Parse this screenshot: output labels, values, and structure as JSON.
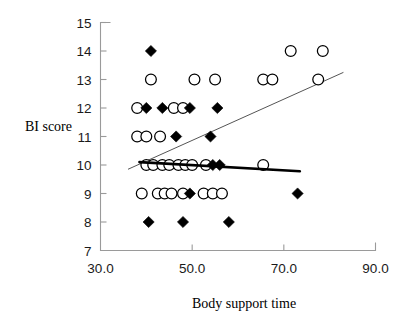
{
  "chart_data": {
    "type": "scatter",
    "title": "",
    "xlabel": "Body support time",
    "ylabel": "BI score",
    "xlim": [
      30.0,
      90.0
    ],
    "ylim": [
      7,
      15
    ],
    "xticks": [
      30.0,
      50.0,
      70.0,
      90.0
    ],
    "xtick_labels": [
      "30.0",
      "50.0",
      "70.0",
      "90.0"
    ],
    "yticks": [
      7,
      8,
      9,
      10,
      11,
      12,
      13,
      14,
      15
    ],
    "ytick_labels": [
      "7",
      "8",
      "9",
      "10",
      "11",
      "12",
      "13",
      "14",
      "15"
    ],
    "grid": false,
    "legend": "none",
    "series": [
      {
        "name": "open-circle-group",
        "marker": "open-circle",
        "color": "#ffffff",
        "edge_color": "#000000",
        "points": [
          {
            "x": 71.5,
            "y": 14
          },
          {
            "x": 78.5,
            "y": 14
          },
          {
            "x": 41.0,
            "y": 13
          },
          {
            "x": 50.5,
            "y": 13
          },
          {
            "x": 55.0,
            "y": 13
          },
          {
            "x": 65.5,
            "y": 13
          },
          {
            "x": 67.5,
            "y": 13
          },
          {
            "x": 77.5,
            "y": 13
          },
          {
            "x": 38.0,
            "y": 12
          },
          {
            "x": 46.0,
            "y": 12
          },
          {
            "x": 48.0,
            "y": 12
          },
          {
            "x": 38.0,
            "y": 11
          },
          {
            "x": 40.0,
            "y": 11
          },
          {
            "x": 43.0,
            "y": 11
          },
          {
            "x": 40.0,
            "y": 10
          },
          {
            "x": 41.5,
            "y": 10
          },
          {
            "x": 43.5,
            "y": 10
          },
          {
            "x": 45.0,
            "y": 10
          },
          {
            "x": 47.0,
            "y": 10
          },
          {
            "x": 48.5,
            "y": 10
          },
          {
            "x": 50.0,
            "y": 10
          },
          {
            "x": 53.0,
            "y": 10
          },
          {
            "x": 65.5,
            "y": 10
          },
          {
            "x": 39.0,
            "y": 9
          },
          {
            "x": 42.5,
            "y": 9
          },
          {
            "x": 44.0,
            "y": 9
          },
          {
            "x": 45.5,
            "y": 9
          },
          {
            "x": 48.0,
            "y": 9
          },
          {
            "x": 52.5,
            "y": 9
          },
          {
            "x": 54.5,
            "y": 9
          },
          {
            "x": 56.5,
            "y": 9
          }
        ]
      },
      {
        "name": "filled-diamond-group",
        "marker": "filled-diamond",
        "color": "#000000",
        "points": [
          {
            "x": 41.0,
            "y": 14
          },
          {
            "x": 40.0,
            "y": 12
          },
          {
            "x": 43.5,
            "y": 12
          },
          {
            "x": 49.5,
            "y": 12
          },
          {
            "x": 55.5,
            "y": 12
          },
          {
            "x": 46.5,
            "y": 11
          },
          {
            "x": 54.0,
            "y": 11
          },
          {
            "x": 54.5,
            "y": 10
          },
          {
            "x": 56.0,
            "y": 10
          },
          {
            "x": 49.5,
            "y": 9
          },
          {
            "x": 73.0,
            "y": 9
          },
          {
            "x": 40.5,
            "y": 8
          },
          {
            "x": 48.0,
            "y": 8
          },
          {
            "x": 58.0,
            "y": 8
          }
        ]
      }
    ],
    "trend_lines": [
      {
        "name": "rising-thin-trend-line",
        "style": "thin",
        "color": "#555555",
        "x_start": 36.0,
        "y_start": 9.85,
        "x_end": 83.0,
        "y_end": 13.25
      },
      {
        "name": "flat-thick-trend-line",
        "style": "thick",
        "color": "#000000",
        "x_start": 38.5,
        "y_start": 10.1,
        "x_end": 73.5,
        "y_end": 9.78
      }
    ]
  }
}
